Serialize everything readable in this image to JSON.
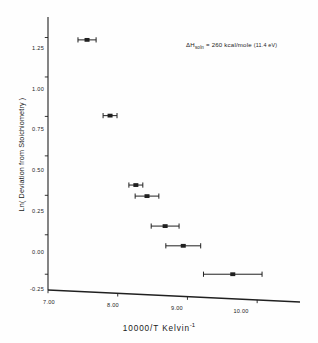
{
  "figure": {
    "annotation": {
      "delta": "ΔH",
      "subscript": "soln",
      "equals_value": " = 260 kcal/mole ",
      "paren": "(11.4 eV)"
    }
  },
  "chart_data": {
    "type": "scatter",
    "title": "",
    "xlabel_main": "10000/T  Kelvin",
    "xlabel_sup": "-1",
    "ylabel": "Ln( Deviation from Stoichiometry )",
    "xlim": [
      7.0,
      10.6
    ],
    "ylim": [
      -0.35,
      1.38
    ],
    "grid": false,
    "legend": "none",
    "xticks": [
      7.0,
      8.0,
      9.0,
      10.0
    ],
    "xticklabels": [
      "7.00",
      "8.00",
      "9.00",
      "10.00"
    ],
    "yticks": [
      1.25,
      1.0,
      0.75,
      0.5,
      0.25,
      0.0,
      -0.25
    ],
    "yticklabels": [
      "1.25",
      "1.00",
      "0.75",
      "0.50",
      "0.25",
      "0.00",
      "-0.25"
    ],
    "x": [
      7.56,
      7.89,
      8.26,
      8.42,
      8.68,
      8.94,
      9.65
    ],
    "y": [
      1.235,
      0.755,
      0.315,
      0.245,
      0.055,
      -0.07,
      -0.25
    ],
    "xerr": [
      0.13,
      0.1,
      0.1,
      0.17,
      0.2,
      0.25,
      0.42
    ],
    "series_name": "Deviation from stoichiometry",
    "marker": "square",
    "annotations": [
      "ΔH_soln = 260 kcal/mole (11.4 eV)"
    ]
  }
}
